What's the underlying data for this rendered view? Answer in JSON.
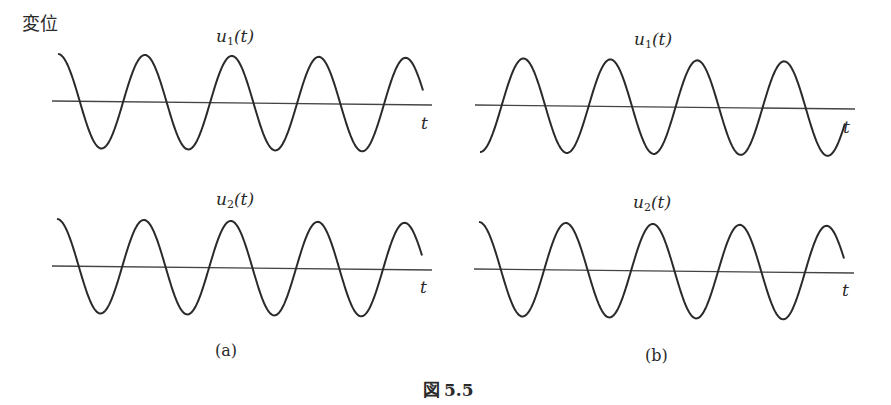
{
  "figure": {
    "y_axis_label": "変位",
    "caption": "図 5.5",
    "caption_prefix": "図",
    "caption_number": "5.5"
  },
  "panels": [
    {
      "id": "a",
      "label": "(a)",
      "plots": [
        {
          "title_var": "u",
          "title_sub": "1",
          "title_arg": "(t)",
          "axis_label": "t",
          "phase": "cos"
        },
        {
          "title_var": "u",
          "title_sub": "2",
          "title_arg": "(t)",
          "axis_label": "t",
          "phase": "cos"
        }
      ]
    },
    {
      "id": "b",
      "label": "(b)",
      "plots": [
        {
          "title_var": "u",
          "title_sub": "1",
          "title_arg": "(t)",
          "axis_label": "t",
          "phase": "-cos"
        },
        {
          "title_var": "u",
          "title_sub": "2",
          "title_arg": "(t)",
          "axis_label": "t",
          "phase": "cos"
        }
      ]
    }
  ],
  "chart_data": [
    {
      "type": "line",
      "title": "u1(t) (a)",
      "xlabel": "t",
      "ylabel": "変位",
      "series": [
        {
          "name": "u1(t)",
          "function": "cos",
          "cycles": 4.2,
          "amplitude": 1,
          "phase_deg": 0
        }
      ]
    },
    {
      "type": "line",
      "title": "u2(t) (a)",
      "xlabel": "t",
      "ylabel": "変位",
      "series": [
        {
          "name": "u2(t)",
          "function": "cos",
          "cycles": 4.2,
          "amplitude": 1,
          "phase_deg": 0
        }
      ]
    },
    {
      "type": "line",
      "title": "u1(t) (b)",
      "xlabel": "t",
      "ylabel": "変位",
      "series": [
        {
          "name": "u1(t)",
          "function": "cos",
          "cycles": 4.2,
          "amplitude": 1,
          "phase_deg": 180
        }
      ]
    },
    {
      "type": "line",
      "title": "u2(t) (b)",
      "xlabel": "t",
      "ylabel": "変位",
      "series": [
        {
          "name": "u2(t)",
          "function": "cos",
          "cycles": 4.2,
          "amplitude": 1,
          "phase_deg": 0
        }
      ]
    }
  ]
}
